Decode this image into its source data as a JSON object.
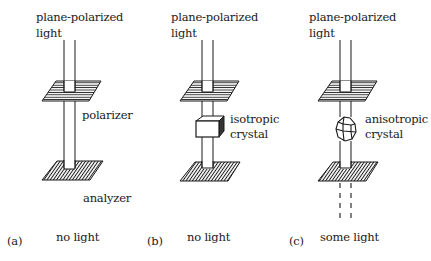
{
  "panels": [
    {
      "id": "a",
      "tag": "(a)",
      "top_label_line1": "plane-polarized",
      "top_label_line2": "light",
      "middle_label": "polarizer",
      "bottom_plate_label": "analyzer",
      "result": "no light"
    },
    {
      "id": "b",
      "tag": "(b)",
      "top_label_line1": "plane-polarized",
      "top_label_line2": "light",
      "crystal_label_line1": "isotropic",
      "crystal_label_line2": "crystal",
      "result": "no light"
    },
    {
      "id": "c",
      "tag": "(c)",
      "top_label_line1": "plane-polarized",
      "top_label_line2": "light",
      "crystal_label_line1": "anisotropic",
      "crystal_label_line2": "crystal",
      "result": "some light"
    }
  ],
  "colors": {
    "ink": "#1a1a1a",
    "background": "#ffffff"
  }
}
